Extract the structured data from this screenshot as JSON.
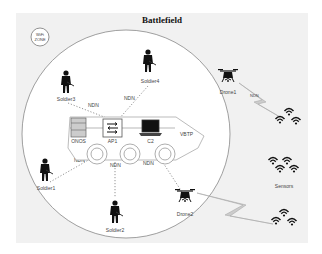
{
  "title": "Battlefield",
  "wifi_zone": {
    "line1": "WiFi",
    "line2": "ZONE"
  },
  "vehicle": {
    "label": "VBTP"
  },
  "nodes": {
    "onos": "ONOS",
    "ap1": "AP1",
    "c2": "C2",
    "soldier1": "Soldier1",
    "soldier2": "Soldier2",
    "soldier3": "Soldier3",
    "soldier4": "Soldier4",
    "drone1": "Drone1",
    "drone2": "Drone2",
    "sensors": "Sensors"
  },
  "links": {
    "soldier3_ap1": "NDN",
    "soldier4_ap1": "NDN",
    "soldier1_onos": "NDN",
    "soldier2_ap1": "NDN",
    "drone2_c2": "NDN",
    "drone1_sensors": "NDN"
  },
  "colors": {
    "panel": "#f1f1f1",
    "circle": "#888888",
    "lightning": "#bbbbbb",
    "icon": "#111111"
  }
}
